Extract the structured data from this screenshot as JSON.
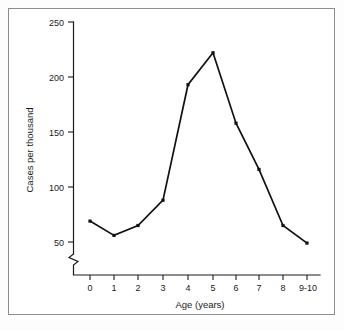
{
  "chart_data": {
    "type": "line",
    "title": "",
    "subtitle": "",
    "xlabel": "Age (years)",
    "ylabel": "Cases per thousand",
    "categories": [
      "0",
      "1",
      "2",
      "3",
      "4",
      "5",
      "6",
      "7",
      "8",
      "9-10"
    ],
    "values": [
      69,
      56,
      65,
      88,
      193,
      222,
      158,
      116,
      65,
      49
    ],
    "series": [
      {
        "name": "Cases per thousand",
        "values": [
          69,
          56,
          65,
          88,
          193,
          222,
          158,
          116,
          65,
          49
        ]
      }
    ],
    "x_tick_labels": [
      "0",
      "1",
      "2",
      "3",
      "4",
      "5",
      "6",
      "7",
      "8",
      "9-10"
    ],
    "y_tick_labels": [
      "50",
      "100",
      "150",
      "200",
      "250"
    ],
    "y_tick_values": [
      50,
      100,
      150,
      200,
      250
    ],
    "ylim": [
      38,
      250
    ],
    "axis_break": true,
    "axis_break_note": "zigzag break on y-axis below 50",
    "grid": false,
    "legend": false,
    "legend_position": "none",
    "marker": "square",
    "line_color": "#111111",
    "marker_color": "#111111",
    "axis_color": "#1a1a1a",
    "background_color": "#ffffff",
    "frame_color": "#8d8d8d"
  },
  "figure": {
    "border_present": true
  }
}
